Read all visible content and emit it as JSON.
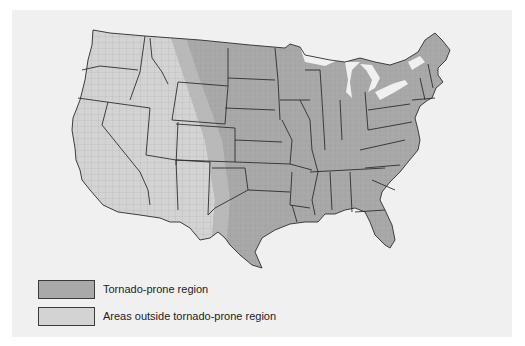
{
  "map": {
    "title": "",
    "regions": [
      {
        "name": "Tornado-prone region",
        "color": "#a9a9a9"
      },
      {
        "name": "Areas outside tornado-prone region",
        "color": "#d3d3d3"
      }
    ],
    "background_color": "#f0f0f0",
    "boundary_color": "#2e2e2e"
  },
  "legend": {
    "items": [
      {
        "label": "Tornado-prone region",
        "color": "#a9a9a9"
      },
      {
        "label": "Areas outside tornado-prone region",
        "color": "#d3d3d3"
      }
    ]
  }
}
